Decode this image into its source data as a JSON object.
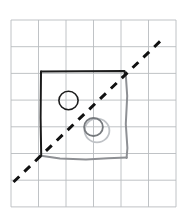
{
  "figure": {
    "canvas": {
      "width": 184,
      "height": 223,
      "background": "#ffffff"
    },
    "grid": {
      "name": "graph-paper-grid",
      "color": "#b9bcc0",
      "stroke_width": 0.9,
      "x_start": 11,
      "y_start": 20,
      "cell_width": 27.5,
      "cell_height": 26.7,
      "columns": 6,
      "rows": 7,
      "x_lines": [
        11,
        38.5,
        66,
        93.5,
        121,
        148.5,
        176
      ],
      "y_lines": [
        20,
        46.7,
        73.4,
        100.1,
        126.8,
        153.5,
        180.2,
        206.9
      ]
    },
    "shapes": {
      "black_square": {
        "name": "black-square-outline",
        "color": "#1b1b1b",
        "stroke_width": 2.0,
        "points": "41,71.5 124.5,71 125,74"
      },
      "black_square_left": {
        "name": "black-square-left-edge",
        "color": "#1b1b1b",
        "stroke_width": 2.0,
        "points": "41,71.5 40.6,118 41.2,155.5"
      },
      "gray_square_right": {
        "name": "gray-square-right-edge",
        "color": "#8e9094",
        "stroke_width": 2.0,
        "points": "125.6,72 127.2,96 125.8,124 127.4,148 126.6,158"
      },
      "gray_square_bottom": {
        "name": "gray-square-bottom-edge",
        "color": "#8e9094",
        "stroke_width": 2.0,
        "points": "41,155.8 60,158.6 86,159.4 108,158.2 126.8,157.4"
      },
      "black_circle": {
        "name": "black-circle",
        "color": "#1b1b1b",
        "stroke_width": 1.6,
        "cx": 68.5,
        "cy": 100.5,
        "rx": 9.6,
        "ry": 9.2
      },
      "gray_circle_dark": {
        "name": "gray-circle-inner",
        "color": "#76797d",
        "stroke_width": 1.8,
        "cx": 93.5,
        "cy": 127.0,
        "rx": 9.4,
        "ry": 9.0
      },
      "gray_circle_light": {
        "name": "gray-circle-outer",
        "color": "#bfc2c6",
        "stroke_width": 1.8,
        "cx": 97.0,
        "cy": 130.5,
        "rx": 12.4,
        "ry": 11.8
      },
      "dashed_diagonal": {
        "name": "dashed-diagonal-line",
        "color": "#111111",
        "stroke_width": 3.0,
        "dash_pattern": "8 7",
        "x1": 13.5,
        "y1": 182.0,
        "x2": 161.5,
        "y2": 40.0
      }
    }
  }
}
